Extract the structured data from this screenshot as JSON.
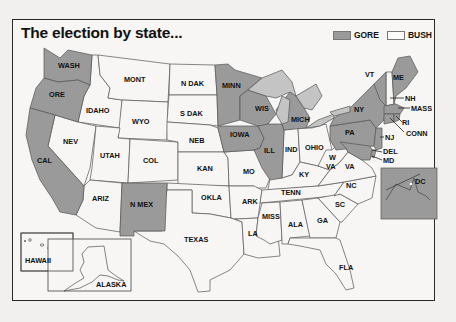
{
  "title": "The election by state...",
  "legend": [
    {
      "label": "GORE",
      "color": "#9a9a9a"
    },
    {
      "label": "BUSH",
      "color": "#f7f6f4"
    }
  ],
  "colors": {
    "gore": "#9a9a9a",
    "bush": "#f7f6f4",
    "lakes": "#c4c4c4",
    "border": "#2a2a2a"
  },
  "states": [
    {
      "abbr": "WASH",
      "winner": "GORE"
    },
    {
      "abbr": "ORE",
      "winner": "GORE"
    },
    {
      "abbr": "CAL",
      "winner": "GORE"
    },
    {
      "abbr": "IDAHO",
      "winner": "BUSH"
    },
    {
      "abbr": "NEV",
      "winner": "BUSH"
    },
    {
      "abbr": "MONT",
      "winner": "BUSH"
    },
    {
      "abbr": "WYO",
      "winner": "BUSH"
    },
    {
      "abbr": "UTAH",
      "winner": "BUSH"
    },
    {
      "abbr": "ARIZ",
      "winner": "BUSH"
    },
    {
      "abbr": "COL",
      "winner": "BUSH"
    },
    {
      "abbr": "N MEX",
      "winner": "GORE"
    },
    {
      "abbr": "N DAK",
      "winner": "BUSH"
    },
    {
      "abbr": "S DAK",
      "winner": "BUSH"
    },
    {
      "abbr": "NEB",
      "winner": "BUSH"
    },
    {
      "abbr": "KAN",
      "winner": "BUSH"
    },
    {
      "abbr": "OKLA",
      "winner": "BUSH"
    },
    {
      "abbr": "TEXAS",
      "winner": "BUSH"
    },
    {
      "abbr": "MINN",
      "winner": "GORE"
    },
    {
      "abbr": "IOWA",
      "winner": "GORE"
    },
    {
      "abbr": "MO",
      "winner": "BUSH"
    },
    {
      "abbr": "ARK",
      "winner": "BUSH"
    },
    {
      "abbr": "LA",
      "winner": "BUSH"
    },
    {
      "abbr": "WIS",
      "winner": "GORE"
    },
    {
      "abbr": "ILL",
      "winner": "GORE"
    },
    {
      "abbr": "MICH",
      "winner": "GORE"
    },
    {
      "abbr": "IND",
      "winner": "BUSH"
    },
    {
      "abbr": "OHIO",
      "winner": "BUSH"
    },
    {
      "abbr": "KY",
      "winner": "BUSH"
    },
    {
      "abbr": "TENN",
      "winner": "BUSH"
    },
    {
      "abbr": "MISS",
      "winner": "BUSH"
    },
    {
      "abbr": "ALA",
      "winner": "BUSH"
    },
    {
      "abbr": "GA",
      "winner": "BUSH"
    },
    {
      "abbr": "FLA",
      "winner": "BUSH"
    },
    {
      "abbr": "SC",
      "winner": "BUSH"
    },
    {
      "abbr": "NC",
      "winner": "BUSH"
    },
    {
      "abbr": "VA",
      "winner": "BUSH"
    },
    {
      "abbr": "W VA",
      "winner": "BUSH"
    },
    {
      "abbr": "PA",
      "winner": "GORE"
    },
    {
      "abbr": "NY",
      "winner": "GORE"
    },
    {
      "abbr": "VT",
      "winner": "GORE"
    },
    {
      "abbr": "NH",
      "winner": "BUSH"
    },
    {
      "abbr": "ME",
      "winner": "GORE"
    },
    {
      "abbr": "MASS",
      "winner": "GORE"
    },
    {
      "abbr": "RI",
      "winner": "GORE"
    },
    {
      "abbr": "CONN",
      "winner": "GORE"
    },
    {
      "abbr": "NJ",
      "winner": "GORE"
    },
    {
      "abbr": "DEL",
      "winner": "GORE"
    },
    {
      "abbr": "MD",
      "winner": "GORE"
    },
    {
      "abbr": "DC",
      "winner": "GORE"
    },
    {
      "abbr": "HAWAII",
      "winner": "GORE"
    },
    {
      "abbr": "ALASKA",
      "winner": "BUSH"
    }
  ],
  "labels": {
    "WASH": "WASH",
    "ORE": "ORE",
    "CAL": "CAL",
    "IDAHO": "IDAHO",
    "NEV": "NEV",
    "MONT": "MONT",
    "WYO": "WYO",
    "UTAH": "UTAH",
    "ARIZ": "ARIZ",
    "COL": "COL",
    "NMEX": "N MEX",
    "NDAK": "N DAK",
    "SDAK": "S DAK",
    "NEB": "NEB",
    "KAN": "KAN",
    "OKLA": "OKLA",
    "TEXAS": "TEXAS",
    "MINN": "MINN",
    "IOWA": "IOWA",
    "MO": "MO",
    "ARK": "ARK",
    "LA": "LA",
    "WIS": "WIS",
    "ILL": "ILL",
    "MICH": "MICH",
    "IND": "IND",
    "OHIO": "OHIO",
    "KY": "KY",
    "TENN": "TENN",
    "MISS": "MISS",
    "ALA": "ALA",
    "GA": "GA",
    "FLA": "FLA",
    "SC": "SC",
    "NC": "NC",
    "VA": "VA",
    "WVA1": "W",
    "WVA2": "VA",
    "PA": "PA",
    "NY": "NY",
    "VT": "VT",
    "NH": "NH",
    "ME": "ME",
    "MASS": "MASS",
    "RI": "RI",
    "CONN": "CONN",
    "NJ": "NJ",
    "DEL": "DEL",
    "MD": "MD",
    "DC": "DC",
    "HAWAII": "HAWAII",
    "ALASKA": "ALASKA"
  }
}
